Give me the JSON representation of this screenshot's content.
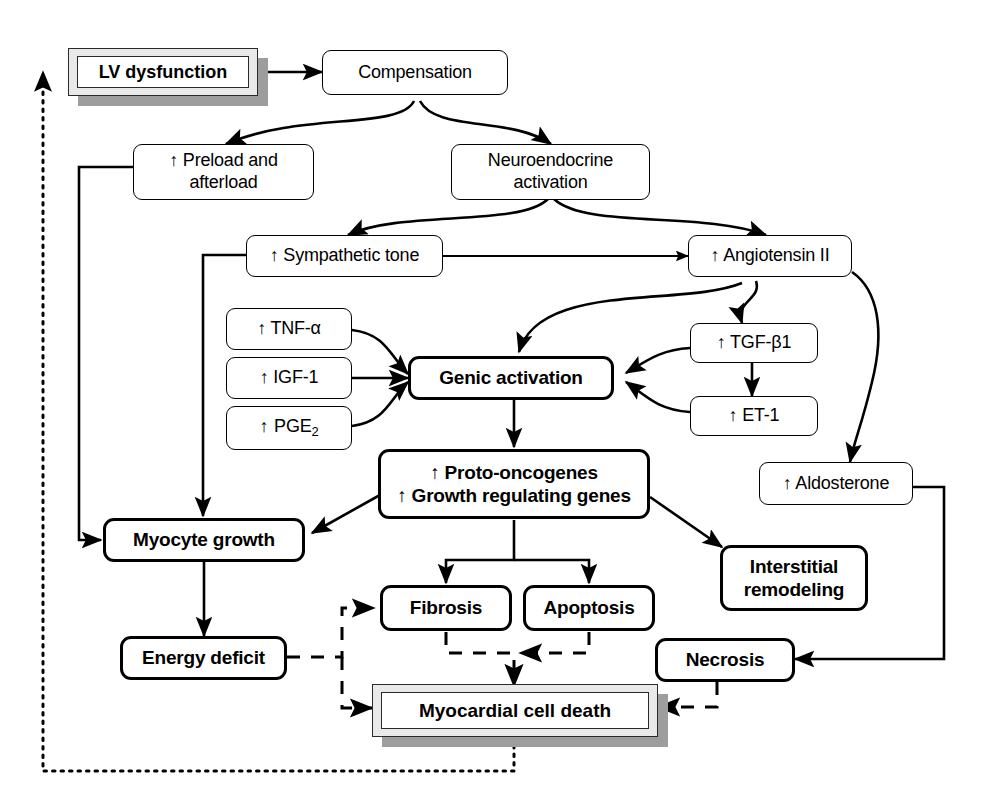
{
  "diagram": {
    "background": "#ffffff",
    "line_color": "#000000",
    "shadow_color": "#9d9d9d",
    "arrow_glyph": "↑"
  },
  "nodes": {
    "lv_dysfunction": {
      "label": "LV dysfunction",
      "style": "3d-bold"
    },
    "compensation": {
      "label": "Compensation",
      "style": "plain"
    },
    "preload_afterload": {
      "label": "↑ Preload and afterload",
      "line1": "↑ Preload and",
      "line2": "afterload",
      "style": "plain"
    },
    "neuroendocrine": {
      "label": "Neuroendocrine activation",
      "line1": "Neuroendocrine",
      "line2": "activation",
      "style": "plain"
    },
    "sympathetic_tone": {
      "label": "↑ Sympathetic tone",
      "style": "plain"
    },
    "angiotensin_ii": {
      "label": "↑ Angiotensin II",
      "style": "plain"
    },
    "tnf_alpha": {
      "label": "↑ TNF-α",
      "style": "plain"
    },
    "igf_1": {
      "label": "↑ IGF-1",
      "style": "plain"
    },
    "pge_2": {
      "label": "↑ PGE2",
      "style": "plain"
    },
    "tgf_beta1": {
      "label": "↑ TGF-β1",
      "style": "plain"
    },
    "et_1": {
      "label": "↑ ET-1",
      "style": "plain"
    },
    "aldosterone": {
      "label": "↑ Aldosterone",
      "style": "plain"
    },
    "genic_activation": {
      "label": "Genic activation",
      "style": "bold"
    },
    "proto_oncogenes": {
      "label": "↑ Proto-oncogenes ↑ Growth regulating genes",
      "line1": "↑ Proto-oncogenes",
      "line2": "↑ Growth regulating genes",
      "style": "bold"
    },
    "myocyte_growth": {
      "label": "Myocyte growth",
      "style": "bold"
    },
    "interstitial_remodeling": {
      "label": "Interstitial remodeling",
      "line1": "Interstitial",
      "line2": "remodeling",
      "style": "bold"
    },
    "fibrosis": {
      "label": "Fibrosis",
      "style": "bold"
    },
    "apoptosis": {
      "label": "Apoptosis",
      "style": "bold"
    },
    "energy_deficit": {
      "label": "Energy deficit",
      "style": "bold"
    },
    "necrosis": {
      "label": "Necrosis",
      "style": "bold"
    },
    "myocardial_cell_death": {
      "label": "Myocardial cell death",
      "style": "3d-bold"
    }
  },
  "edges": [
    {
      "from": "lv_dysfunction",
      "to": "compensation",
      "style": "solid"
    },
    {
      "from": "compensation",
      "to": "preload_afterload",
      "style": "solid-curve"
    },
    {
      "from": "compensation",
      "to": "neuroendocrine",
      "style": "solid-curve"
    },
    {
      "from": "neuroendocrine",
      "to": "sympathetic_tone",
      "style": "solid-curve"
    },
    {
      "from": "neuroendocrine",
      "to": "angiotensin_ii",
      "style": "solid-curve"
    },
    {
      "from": "angiotensin_ii",
      "to": "sympathetic_tone",
      "style": "solid-bidirectional"
    },
    {
      "from": "angiotensin_ii",
      "to": "genic_activation",
      "style": "solid-curve"
    },
    {
      "from": "angiotensin_ii",
      "to": "tgf_beta1",
      "style": "solid-curve"
    },
    {
      "from": "angiotensin_ii",
      "to": "aldosterone",
      "style": "solid-curve"
    },
    {
      "from": "tgf_beta1",
      "to": "et_1",
      "style": "solid"
    },
    {
      "from": "tgf_beta1",
      "to": "genic_activation",
      "style": "solid-curve"
    },
    {
      "from": "et_1",
      "to": "genic_activation",
      "style": "solid-curve"
    },
    {
      "from": "tnf_alpha",
      "to": "genic_activation",
      "style": "solid-curve"
    },
    {
      "from": "igf_1",
      "to": "genic_activation",
      "style": "solid"
    },
    {
      "from": "pge_2",
      "to": "genic_activation",
      "style": "solid-curve"
    },
    {
      "from": "genic_activation",
      "to": "proto_oncogenes",
      "style": "solid"
    },
    {
      "from": "proto_oncogenes",
      "to": "myocyte_growth",
      "style": "solid-diagonal"
    },
    {
      "from": "proto_oncogenes",
      "to": "interstitial_remodeling",
      "style": "solid-diagonal"
    },
    {
      "from": "proto_oncogenes",
      "to": "fibrosis",
      "style": "solid-elbow"
    },
    {
      "from": "proto_oncogenes",
      "to": "apoptosis",
      "style": "solid-elbow"
    },
    {
      "from": "preload_afterload",
      "to": "myocyte_growth",
      "style": "solid-elbow"
    },
    {
      "from": "sympathetic_tone",
      "to": "myocyte_growth",
      "style": "solid-elbow"
    },
    {
      "from": "myocyte_growth",
      "to": "energy_deficit",
      "style": "solid"
    },
    {
      "from": "aldosterone",
      "to": "necrosis",
      "style": "solid-elbow"
    },
    {
      "from": "energy_deficit",
      "to": "fibrosis",
      "style": "dashed-elbow"
    },
    {
      "from": "energy_deficit",
      "to": "myocardial_cell_death",
      "style": "dashed-elbow"
    },
    {
      "from": "fibrosis",
      "to": "myocardial_cell_death",
      "style": "dashed-elbow"
    },
    {
      "from": "apoptosis",
      "to": "myocardial_cell_death",
      "style": "dashed-elbow"
    },
    {
      "from": "necrosis",
      "to": "myocardial_cell_death",
      "style": "dashed-elbow"
    },
    {
      "from": "myocardial_cell_death",
      "to": "lv_dysfunction",
      "style": "dotted-feedback"
    }
  ]
}
